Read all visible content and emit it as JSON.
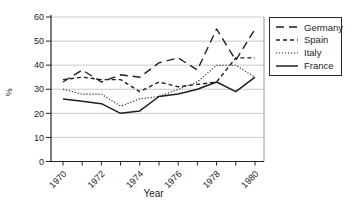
{
  "figure": {
    "xlabel": "Year",
    "ylabel": "%"
  },
  "chart_data": {
    "type": "line",
    "title": "",
    "xlabel": "Year",
    "ylabel": "%",
    "x": [
      1970,
      1971,
      1972,
      1973,
      1974,
      1975,
      1976,
      1977,
      1978,
      1979,
      1980
    ],
    "series": [
      {
        "name": "Germany",
        "line_style": "long-dash",
        "values": [
          33,
          38,
          33,
          36,
          35,
          41,
          43,
          38,
          55,
          42,
          55
        ]
      },
      {
        "name": "Spain",
        "line_style": "dash",
        "values": [
          34,
          35,
          34,
          34,
          29,
          33,
          31,
          32,
          33,
          43,
          43
        ]
      },
      {
        "name": "Italy",
        "line_style": "dotted",
        "values": [
          30,
          28,
          28,
          23,
          26,
          27,
          30,
          33,
          40,
          40,
          35
        ]
      },
      {
        "name": "France",
        "line_style": "solid",
        "values": [
          26,
          25,
          24,
          20,
          21,
          27,
          28,
          30,
          33,
          29,
          35
        ]
      }
    ],
    "ylim": [
      0,
      60
    ],
    "yticks": [
      0,
      10,
      20,
      30,
      40,
      50,
      60
    ],
    "xticklabels": [
      "1970",
      "1972",
      "1974",
      "1976",
      "1978",
      "1980"
    ],
    "grid": "horizontal",
    "legend_position": "outside-top-right",
    "colors": {
      "line": "#1f1f1f",
      "grid": "#c3c3c3",
      "axis": "#222222",
      "plot_border_right": "#9a9a9a",
      "background": "#ffffff"
    }
  }
}
